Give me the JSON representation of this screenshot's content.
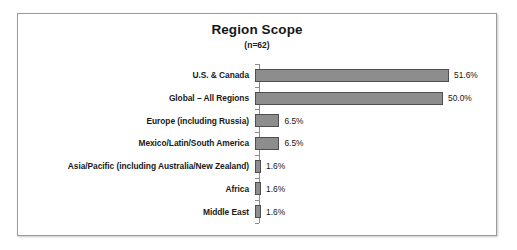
{
  "chart_data": {
    "type": "bar",
    "orientation": "horizontal",
    "title": "Region Scope",
    "subtitle": "(n=62)",
    "xlabel": "",
    "ylabel": "",
    "grid": false,
    "legend": false,
    "value_suffix": "%",
    "xlim": [
      0,
      51.6
    ],
    "categories": [
      "U.S. & Canada",
      "Global – All Regions",
      "Europe (including Russia)",
      "Mexico/Latin/South America",
      "Asia/Pacific (including Australia/New Zealand)",
      "Africa",
      "Middle East"
    ],
    "values": [
      51.6,
      50.0,
      6.5,
      6.5,
      1.6,
      1.6,
      1.6
    ],
    "value_labels": [
      "51.6%",
      "50.0%",
      "6.5%",
      "6.5%",
      "1.6%",
      "1.6%",
      "1.6%"
    ],
    "colors": {
      "bar_fill": "#8d8d8d",
      "bar_border": "#4f4f4f",
      "axis": "#8c8c8c",
      "frame": "#9a9a9a",
      "text": "#1a1a1a",
      "background": "#ffffff"
    }
  }
}
